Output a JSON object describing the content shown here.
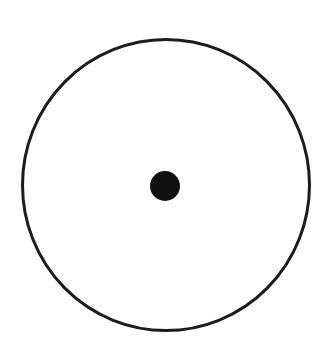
{
  "diagram": {
    "background": "#ffffff",
    "outer_circle": {
      "cx": 166,
      "cy": 185,
      "rx": 143.5,
      "ry": 145.5,
      "stroke": "#1c1c1c",
      "stroke_width": 3
    },
    "center_dot": {
      "cx": 165,
      "cy": 186,
      "r": 15,
      "fill": "#111111"
    }
  }
}
